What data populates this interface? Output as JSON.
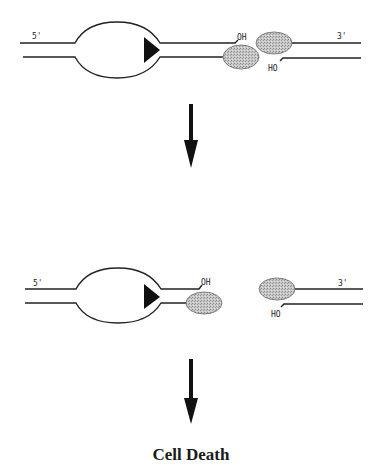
{
  "diagram": {
    "panels": [
      {
        "id": "panel-1",
        "labels": {
          "five_prime": "5'",
          "three_prime": "3'",
          "oh": "OH",
          "ho": "HO"
        },
        "description": "Transcription bubble with polymerase approaching DNA nick bound by two proteins"
      },
      {
        "id": "panel-2",
        "labels": {
          "five_prime": "5'",
          "three_prime": "3'",
          "oh": "OH",
          "ho": "HO"
        },
        "description": "Collision converts nick into double-strand break"
      }
    ],
    "outcome": "Cell Death",
    "colors": {
      "line": "#222222",
      "protein_fill": "#bdbdbd",
      "polymerase": "#111111"
    }
  }
}
